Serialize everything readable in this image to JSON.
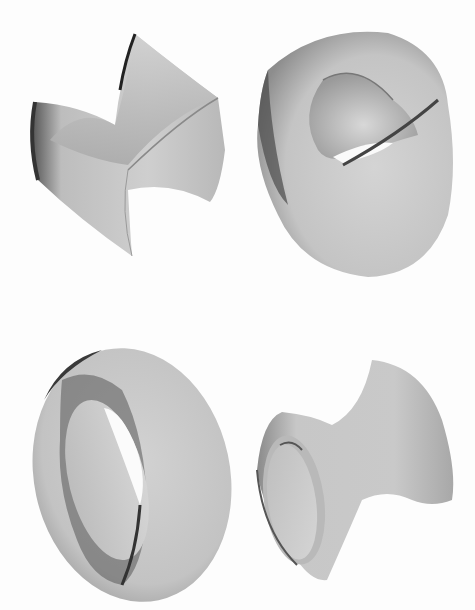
{
  "figure": {
    "background": "#fdfdfd",
    "surface_color": "#c8c8c8",
    "shadow_color": "#3a3a3a",
    "panels": [
      {
        "id": "top-left",
        "shape": "saddle-surface"
      },
      {
        "id": "top-right",
        "shape": "cross-cap-like-surface-with-opening"
      },
      {
        "id": "bottom-left",
        "shape": "torus-like-ring-surface"
      },
      {
        "id": "bottom-right",
        "shape": "hyperboloid-trumpet-surface"
      }
    ]
  }
}
